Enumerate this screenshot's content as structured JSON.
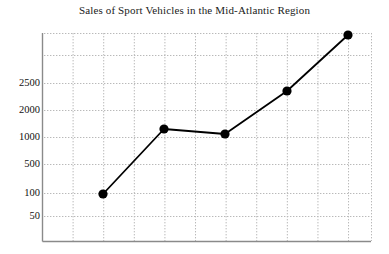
{
  "chart_data": {
    "type": "line",
    "title": "Sales of Sport Vehicles in the Mid-Atlantic Region",
    "xlabel": "",
    "ylabel": "",
    "grid": true,
    "legend": null,
    "y_scale": "log-like-irregular",
    "y_tick_labels": [
      "2500",
      "2000",
      "1000",
      "500",
      "100",
      "50"
    ],
    "y_tick_pixels": [
      83,
      110,
      137,
      164,
      193,
      216
    ],
    "x_tick_labels": [],
    "x_gridline_count": 10,
    "series": [
      {
        "name": "Sales",
        "marker": "filled-circle",
        "color": "#000000",
        "x": [
          1,
          2,
          3,
          4,
          5
        ],
        "values": [
          100,
          1300,
          1100,
          2350,
          4200
        ],
        "point_pixels": [
          {
            "x": 103,
            "y": 194
          },
          {
            "x": 164,
            "y": 129
          },
          {
            "x": 225,
            "y": 134
          },
          {
            "x": 287,
            "y": 91
          },
          {
            "x": 348,
            "y": 35
          }
        ]
      }
    ],
    "plot_area": {
      "left": 42,
      "top": 33,
      "right": 371,
      "bottom": 241
    },
    "axis_color": "#8a8a8a",
    "grid_color": "#b9b9b9",
    "line_color": "#000000"
  },
  "yticks": [
    {
      "label": "2500",
      "y": 83
    },
    {
      "label": "2000",
      "y": 110
    },
    {
      "label": "1000",
      "y": 137
    },
    {
      "label": "500",
      "y": 164
    },
    {
      "label": "100",
      "y": 193
    },
    {
      "label": "50",
      "y": 216
    }
  ]
}
